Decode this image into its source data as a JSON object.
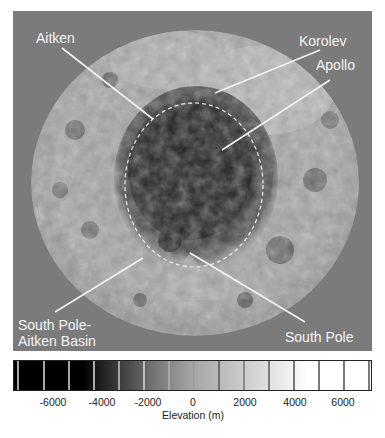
{
  "figure": {
    "type": "lunar topography map, south polar region",
    "background_color": "#7b7b7b"
  },
  "labels": {
    "aitken": "Aitken",
    "korolev": "Korolev",
    "apollo": "Apollo",
    "spa_line1": "South Pole-",
    "spa_line2": "Aitken Basin",
    "south_pole": "South Pole"
  },
  "colorbar": {
    "title": "Elevation (m)",
    "min": -7000,
    "max": 7000,
    "tick_labels": [
      "-6000",
      "-4000",
      "-2000",
      "0",
      "2000",
      "4000",
      "6000"
    ],
    "colors": {
      "low": "#000000",
      "mid": "#a0a0a0",
      "high": "#ffffff"
    }
  }
}
